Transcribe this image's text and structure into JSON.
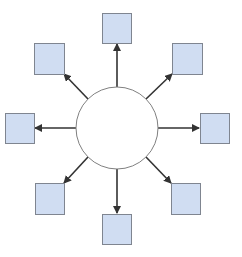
{
  "diagram": {
    "type": "hub-and-spoke",
    "colors": {
      "background": "#ffffff",
      "hub_fill": "#ffffff",
      "hub_stroke": "#808080",
      "node_fill": "#d0ddf2",
      "node_stroke": "#7f8590",
      "arrow": "#333333"
    },
    "hub": {
      "cx": 117,
      "cy": 128,
      "r": 41,
      "label": ""
    },
    "nodes": [
      {
        "id": "top",
        "x": 102,
        "y": 13,
        "w": 29,
        "h": 30
      },
      {
        "id": "top-right",
        "x": 172,
        "y": 43,
        "w": 30,
        "h": 31
      },
      {
        "id": "right",
        "x": 200,
        "y": 113,
        "w": 29,
        "h": 30
      },
      {
        "id": "bottom-right",
        "x": 171,
        "y": 183,
        "w": 29,
        "h": 31
      },
      {
        "id": "bottom",
        "x": 102,
        "y": 214,
        "w": 29,
        "h": 30
      },
      {
        "id": "bottom-left",
        "x": 35,
        "y": 183,
        "w": 29,
        "h": 31
      },
      {
        "id": "left",
        "x": 5,
        "y": 113,
        "w": 29,
        "h": 30
      },
      {
        "id": "top-left",
        "x": 34,
        "y": 43,
        "w": 30,
        "h": 31
      }
    ],
    "arrows": [
      {
        "to": "top",
        "x1": 117,
        "y1": 87,
        "x2": 117,
        "y2": 44
      },
      {
        "to": "top-right",
        "x1": 146,
        "y1": 99,
        "x2": 172,
        "y2": 74
      },
      {
        "to": "right",
        "x1": 158,
        "y1": 128,
        "x2": 199,
        "y2": 128
      },
      {
        "to": "bottom-right",
        "x1": 146,
        "y1": 157,
        "x2": 171,
        "y2": 183
      },
      {
        "to": "bottom",
        "x1": 117,
        "y1": 169,
        "x2": 117,
        "y2": 213
      },
      {
        "to": "bottom-left",
        "x1": 88,
        "y1": 157,
        "x2": 64,
        "y2": 183
      },
      {
        "to": "left",
        "x1": 76,
        "y1": 128,
        "x2": 35,
        "y2": 128
      },
      {
        "to": "top-left",
        "x1": 88,
        "y1": 99,
        "x2": 64,
        "y2": 74
      }
    ]
  }
}
